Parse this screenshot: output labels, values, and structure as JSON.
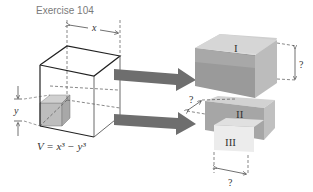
{
  "title": "Exercise 104",
  "labels": {
    "x": "x",
    "y": "y",
    "formula": "V = x³ − y³",
    "box_I": "I",
    "box_II": "II",
    "box_III": "III",
    "unknown_height": "?",
    "unknown_depth": "?",
    "unknown_width": "?"
  },
  "colors": {
    "arrow": "#6e6e6e",
    "box_dark": "#8a8a8a",
    "box_mid": "#b0b0b0",
    "box_light": "#d8d8d8",
    "box_lightest": "#ececec",
    "line": "#222222",
    "dash": "#555555"
  }
}
